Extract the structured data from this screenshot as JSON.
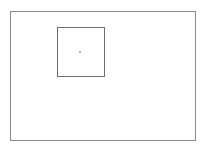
{
  "diagram": {
    "outer_frame": {
      "x": 10,
      "y": 11,
      "width": 186,
      "height": 130,
      "stroke": "#8a8a8a"
    },
    "inner_square": {
      "x": 57,
      "y": 27,
      "width": 48,
      "height": 50,
      "stroke": "#6e6e6e"
    },
    "center_dot": {
      "x": 80,
      "y": 52,
      "color": "#9a9a9a"
    }
  }
}
